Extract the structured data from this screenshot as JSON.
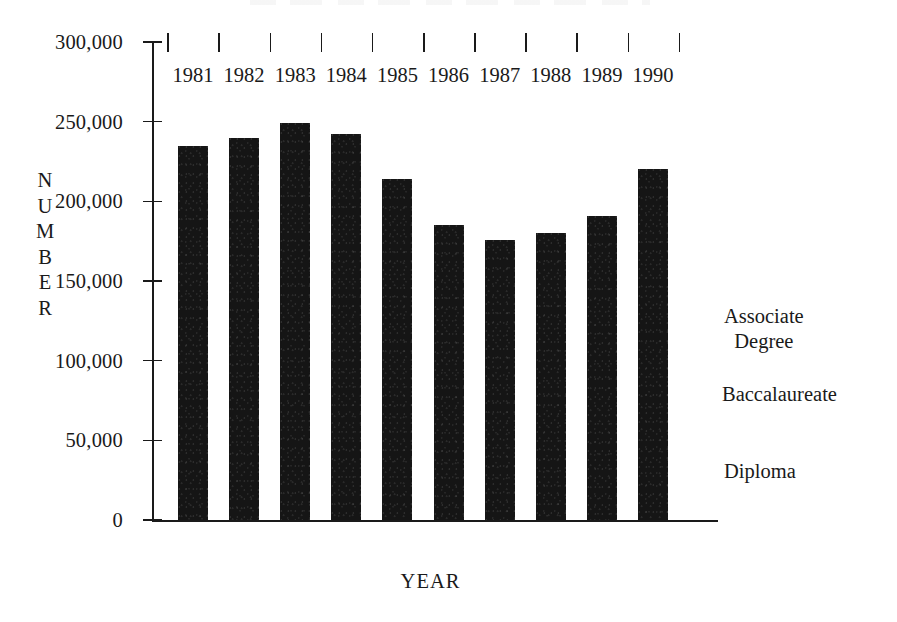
{
  "chart_data": {
    "type": "bar",
    "title": "",
    "xlabel": "YEAR",
    "ylabel": "NUMBER",
    "categories": [
      "1981",
      "1982",
      "1983",
      "1984",
      "1985",
      "1986",
      "1987",
      "1988",
      "1989",
      "1990"
    ],
    "values": [
      235000,
      240000,
      249000,
      242000,
      214000,
      185000,
      176000,
      180000,
      191000,
      220000
    ],
    "ylim": [
      0,
      300000
    ],
    "yticks": [
      0,
      50000,
      100000,
      150000,
      200000,
      250000,
      300000
    ],
    "ytick_labels": [
      "0",
      "50,000",
      "100,000",
      "150,000",
      "200,000",
      "250,000",
      "300,000"
    ],
    "grid": false,
    "legend_position": "right",
    "series": [
      {
        "name": "Associate Degree",
        "values": [
          235000,
          240000,
          249000,
          242000,
          214000,
          185000,
          176000,
          180000,
          191000,
          220000
        ]
      }
    ],
    "annotations": [
      "Associate",
      "Degree",
      "Baccalaureate",
      "Diploma"
    ],
    "bar_color": "#151515"
  },
  "axes": {
    "y_title_letters": [
      "N",
      "U",
      "M",
      "B",
      "E",
      "R"
    ],
    "x_title": "YEAR"
  },
  "legend": {
    "items": [
      {
        "line1": "Associate",
        "line2": "Degree"
      },
      {
        "line1": "Baccalaureate",
        "line2": ""
      },
      {
        "line1": "Diploma",
        "line2": ""
      }
    ]
  }
}
